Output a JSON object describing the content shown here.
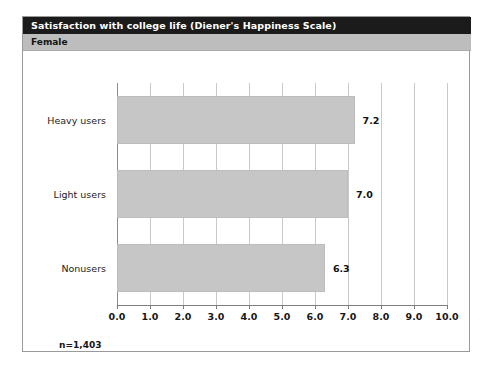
{
  "figure": {
    "title": "Satisfaction with college life (Diener's Happiness Scale)",
    "subtitle": "Female",
    "footnote": "n=1,403",
    "colors": {
      "title_bar": "#1b1b1b",
      "subtitle_bar": "#bdbdbd",
      "bar_fill": "#c6c6c6",
      "gridline": "#c9c9c9",
      "axis": "#7d7d7d",
      "frame": "#9a9a9a"
    }
  },
  "chart_data": {
    "type": "bar",
    "orientation": "horizontal",
    "title": "Satisfaction with college life (Diener's Happiness Scale)",
    "subtitle": "Female",
    "categories": [
      "Heavy users",
      "Light users",
      "Nonusers"
    ],
    "values": [
      7.2,
      7.0,
      6.3
    ],
    "value_labels": [
      "7.2",
      "7.0",
      "6.3"
    ],
    "xlabel": "",
    "ylabel": "",
    "xlim": [
      0,
      10
    ],
    "xticks": [
      0,
      1,
      2,
      3,
      4,
      5,
      6,
      7,
      8,
      9,
      10
    ],
    "xtick_labels": [
      "0.0",
      "1.0",
      "2.0",
      "3.0",
      "4.0",
      "5.0",
      "6.0",
      "7.0",
      "8.0",
      "9.0",
      "10.0"
    ],
    "grid": true,
    "grid_axis": "x",
    "legend": false,
    "annotations": [
      "n=1,403"
    ],
    "sample_size": "n=1,403"
  }
}
